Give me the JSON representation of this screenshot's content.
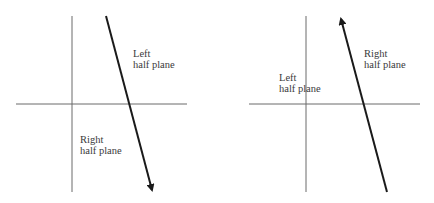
{
  "diagrams": [
    {
      "name": "left-panel",
      "arrow_direction": "down",
      "labels": {
        "upper_right_line1": "Left",
        "upper_right_line2": "half plane",
        "lower_left_line1": "Right",
        "lower_left_line2": "half plane"
      }
    },
    {
      "name": "right-panel",
      "arrow_direction": "up",
      "labels": {
        "upper_right_line1": "Right",
        "upper_right_line2": "half plane",
        "left_line1": "Left",
        "left_line2": "half plane"
      }
    }
  ],
  "colors": {
    "axis": "#6b6b6b",
    "arrow": "#1a1a1a",
    "text": "#3a3a3a"
  }
}
